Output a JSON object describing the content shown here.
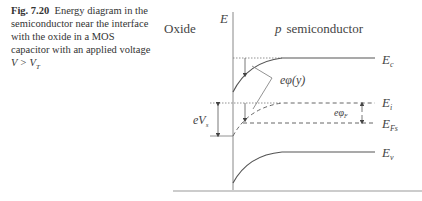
{
  "caption": {
    "figure_label": "Fig. 7.20",
    "text": "Energy diagram in the semiconductor near the interface with the oxide in a MOS capacitor with an applied voltage",
    "condition": "V > V",
    "condition_sub": "T"
  },
  "diagram": {
    "oxide_label": "Oxide",
    "axis_label": "E",
    "region_label_prefix": "p",
    "region_label": "semiconductor",
    "levels": {
      "conduction": {
        "label": "E",
        "sub": "c"
      },
      "intrinsic": {
        "label": "E",
        "sub": "i"
      },
      "fermi": {
        "label": "E",
        "sub": "Fs"
      },
      "valence": {
        "label": "E",
        "sub": "v"
      }
    },
    "annotations": {
      "potential": "eφ(y)",
      "surface_potential": "eV",
      "surface_potential_sub": "s",
      "fermi_potential": "eφ",
      "fermi_potential_sub": "F"
    },
    "colors": {
      "line": "#555555",
      "text": "#444444"
    }
  }
}
